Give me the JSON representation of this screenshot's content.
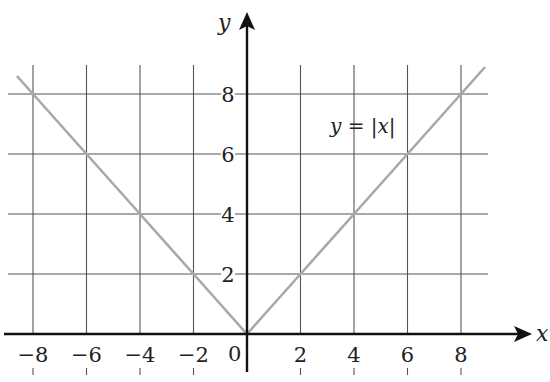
{
  "chart_data": {
    "type": "line",
    "title": "",
    "xlabel": "x",
    "ylabel": "y",
    "xlim": [
      -9,
      9
    ],
    "ylim": [
      0,
      9
    ],
    "grid": true,
    "x_ticks": [
      -8,
      -6,
      -4,
      -2,
      2,
      4,
      6,
      8
    ],
    "x_tick_labels": [
      "−8",
      "−6",
      "−4",
      "−2",
      "2",
      "4",
      "6",
      "8"
    ],
    "y_ticks": [
      2,
      4,
      6,
      8
    ],
    "y_tick_labels": [
      "2",
      "4",
      "6",
      "8"
    ],
    "origin_label": "0",
    "series": [
      {
        "name": "y = |x|",
        "color": "#a8a8a8",
        "x": [
          -8.6,
          -8,
          -6,
          -4,
          -2,
          0,
          2,
          4,
          6,
          8,
          8.9
        ],
        "y": [
          8.6,
          8,
          6,
          4,
          2,
          0,
          2,
          4,
          6,
          8,
          8.9
        ]
      }
    ],
    "annotations": [
      {
        "text": "y = |x|",
        "x": 5.5,
        "y": 7.1
      }
    ]
  },
  "colors": {
    "axis": "#111111",
    "grid": "#555555",
    "curve": "#a8a8a8"
  }
}
